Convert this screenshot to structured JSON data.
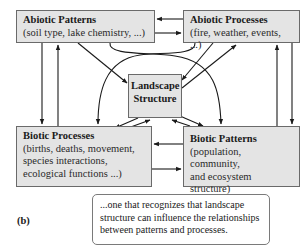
{
  "diagram": {
    "nodes": {
      "abiotic_patterns": {
        "title": "Abiotic Patterns",
        "description": "(soil type, lake chemistry, ...)"
      },
      "abiotic_processes": {
        "title": "Abiotic Processes",
        "description": "(fire, weather, events, ...)"
      },
      "landscape_structure": {
        "title_line1": "Landscape",
        "title_line2": "Structure"
      },
      "biotic_processes": {
        "title": "Biotic Processes",
        "desc_line1": "(births, deaths, movement,",
        "desc_line2": "species interactions,",
        "desc_line3": "ecological functions ...)"
      },
      "biotic_patterns": {
        "title": "Biotic Patterns",
        "desc_line1": "(population, community,",
        "desc_line2": "and ecosystem structure)"
      }
    },
    "edges": [
      {
        "from": "Abiotic Patterns",
        "to": "Abiotic Processes"
      },
      {
        "from": "Abiotic Processes",
        "to": "Abiotic Patterns"
      },
      {
        "from": "Abiotic Patterns",
        "to": "Biotic Processes"
      },
      {
        "from": "Biotic Processes",
        "to": "Abiotic Patterns"
      },
      {
        "from": "Abiotic Processes",
        "to": "Biotic Patterns"
      },
      {
        "from": "Biotic Patterns",
        "to": "Abiotic Processes"
      },
      {
        "from": "Biotic Processes",
        "to": "Biotic Patterns"
      },
      {
        "from": "Biotic Patterns",
        "to": "Biotic Processes"
      },
      {
        "from": "Abiotic Patterns",
        "to": "Landscape Structure"
      },
      {
        "from": "Abiotic Processes",
        "to": "Landscape Structure"
      },
      {
        "from": "Landscape Structure",
        "to": "Abiotic Processes"
      },
      {
        "from": "Abiotic Patterns",
        "to": "Biotic Patterns"
      },
      {
        "from": "Abiotic Processes",
        "to": "Biotic Processes"
      },
      {
        "from": "Landscape Structure",
        "to": "Biotic Processes"
      },
      {
        "from": "Biotic Processes",
        "to": "Landscape Structure"
      },
      {
        "from": "Landscape Structure",
        "to": "Biotic Patterns"
      },
      {
        "from": "Biotic Patterns",
        "to": "Landscape Structure"
      }
    ],
    "panel_label": "(b)",
    "caption": {
      "line1": "...one that recognizes that landscape",
      "line2": "structure can influence the relationships",
      "line3": "between patterns and processes."
    }
  }
}
